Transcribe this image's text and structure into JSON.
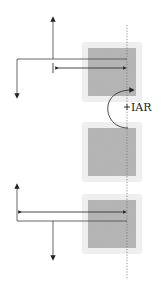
{
  "diagram": {
    "type": "biomechanics-vertebral-motion",
    "labels": {
      "iar": "IAR"
    },
    "colors": {
      "line": "#555555",
      "arrow": "#222222",
      "block_fill": "#a8a8a8",
      "block_halo": "#e6e6e6",
      "axis_dotted": "#777777"
    },
    "elements": {
      "blocks": [
        {
          "name": "upper-vertebra",
          "x": 88,
          "y": 48,
          "w": 48,
          "h": 48
        },
        {
          "name": "middle-vertebra",
          "x": 88,
          "y": 128,
          "w": 48,
          "h": 48
        },
        {
          "name": "lower-vertebra",
          "x": 88,
          "y": 200,
          "w": 48,
          "h": 48
        }
      ],
      "axis": {
        "x": 127,
        "y1": 25,
        "y2": 280,
        "style": "dotted"
      },
      "rotation_arc": {
        "center_label": "IAR",
        "direction": "counterclockwise"
      }
    }
  }
}
